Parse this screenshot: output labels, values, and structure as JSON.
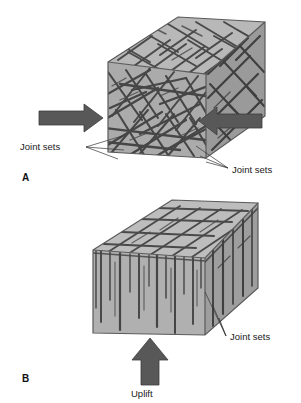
{
  "figure": {
    "background_color": "#ffffff",
    "panels": [
      {
        "id": "A",
        "panel_label": "A",
        "caption_labels": [
          {
            "text": "Joint sets",
            "position": "left"
          },
          {
            "text": "Joint sets",
            "position": "bottom-right"
          }
        ],
        "arrows": [
          {
            "name": "compression-arrow-left",
            "direction": "right",
            "label": ""
          },
          {
            "name": "compression-arrow-right",
            "direction": "left",
            "label": ""
          }
        ],
        "block": {
          "fill_top": "#b8b8b8",
          "fill_front": "#ababab",
          "fill_side": "#9a9a9a",
          "joint_color": "#4a4a4a",
          "joint_pattern": "crisscross"
        }
      },
      {
        "id": "B",
        "panel_label": "B",
        "caption_labels": [
          {
            "text": "Joint sets",
            "position": "bottom-right"
          }
        ],
        "arrows": [
          {
            "name": "uplift-arrow",
            "direction": "up",
            "label": "Uplift"
          }
        ],
        "block": {
          "fill_top": "#bdbdbd",
          "fill_front": "#b0b0b0",
          "fill_side": "#9e9e9e",
          "joint_color": "#4a4a4a",
          "joint_pattern": "columnar-vertical"
        }
      }
    ],
    "colors": {
      "arrow_fill": "#585858",
      "arrow_stroke": "#3d3d3d",
      "outline": "#555555",
      "leader_line": "#333333",
      "text": "#1a1a1a"
    }
  }
}
